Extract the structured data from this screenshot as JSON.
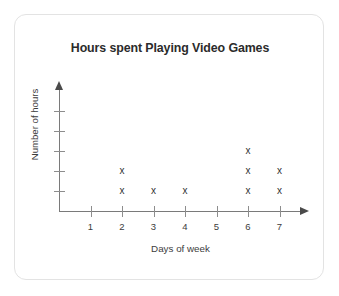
{
  "chart_data": {
    "type": "scatter",
    "title": "Hours spent Playing Video Games",
    "xlabel": "Days of week",
    "ylabel": "Number of hours",
    "marker": "x",
    "grid": false,
    "legend": null,
    "x": [
      1,
      2,
      3,
      4,
      5,
      6,
      7
    ],
    "xtick_labels": [
      "1",
      "2",
      "3",
      "4",
      "5",
      "6",
      "7"
    ],
    "ytick_labels": [
      "",
      "",
      "",
      "",
      ""
    ],
    "xlim": [
      0,
      8
    ],
    "ylim": [
      0,
      6
    ],
    "counts": [
      0,
      2,
      1,
      1,
      0,
      3,
      2
    ],
    "points": [
      {
        "x": 2,
        "y": 1
      },
      {
        "x": 2,
        "y": 2
      },
      {
        "x": 3,
        "y": 1
      },
      {
        "x": 4,
        "y": 1
      },
      {
        "x": 6,
        "y": 1
      },
      {
        "x": 6,
        "y": 2
      },
      {
        "x": 6,
        "y": 3
      },
      {
        "x": 7,
        "y": 1
      },
      {
        "x": 7,
        "y": 2
      }
    ]
  },
  "colors": {
    "card_background": "#ffffff",
    "card_border": "#e3e3e3",
    "title_text": "#2b2b2b",
    "axis_line": "#7a7a7a",
    "axis_text": "#3c3c3c",
    "marker": "#333333"
  }
}
